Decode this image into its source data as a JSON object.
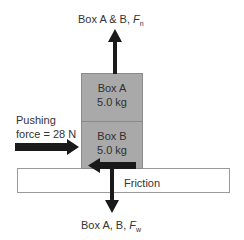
{
  "diagram": {
    "top_force_label": {
      "prefix": "Box A & B, ",
      "symbol": "F",
      "subscript": "n"
    },
    "bottom_force_label": {
      "prefix": "Box A, B, ",
      "symbol": "F",
      "subscript": "w"
    },
    "box_a": {
      "name": "Box A",
      "mass": "5.0 kg"
    },
    "box_b": {
      "name": "Box B",
      "mass": "5.0 kg"
    },
    "pushing_force": {
      "line1": "Pushing",
      "line2": "force = 28 N"
    },
    "surface_label": "Friction",
    "colors": {
      "box_fill": "#a9a9a9",
      "box_border": "#8a8a8a",
      "arrow": "#1a1a1a",
      "surface_border": "#9a9a9a",
      "text": "#333333"
    }
  }
}
